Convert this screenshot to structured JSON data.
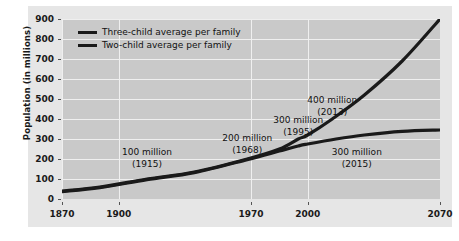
{
  "chart_data": {
    "type": "line",
    "title": "",
    "xlabel": "",
    "ylabel": "Population (in millions)",
    "xlim": [
      1870,
      2070
    ],
    "ylim": [
      0,
      900
    ],
    "grid": true,
    "legend_position": "top-left",
    "x_ticks": [
      "1870",
      "1900",
      "1970",
      "2000",
      "2070"
    ],
    "x_tick_values": [
      1870,
      1900,
      1970,
      2000,
      2070
    ],
    "y_ticks": [
      "0",
      "100",
      "200",
      "300",
      "400",
      "500",
      "600",
      "700",
      "800",
      "900"
    ],
    "y_tick_values": [
      0,
      100,
      200,
      300,
      400,
      500,
      600,
      700,
      800,
      900
    ],
    "series": [
      {
        "name": "Three-child average per family",
        "color": "#1a1a1a",
        "x": [
          1870,
          1890,
          1915,
          1940,
          1968,
          1985,
          1995,
          2000,
          2013,
          2030,
          2050,
          2070
        ],
        "values": [
          40,
          60,
          100,
          135,
          200,
          250,
          300,
          320,
          400,
          520,
          690,
          900
        ]
      },
      {
        "name": "Two-child average per family",
        "color": "#1a1a1a",
        "x": [
          1870,
          1890,
          1915,
          1940,
          1968,
          1985,
          1995,
          2000,
          2015,
          2030,
          2050,
          2070
        ],
        "values": [
          37,
          57,
          97,
          132,
          197,
          240,
          265,
          275,
          300,
          320,
          338,
          345
        ]
      }
    ],
    "annotations": [
      {
        "label": "100 million",
        "sublabel": "(1915)",
        "x": 1915,
        "y": 230
      },
      {
        "label": "200 million",
        "sublabel": "(1968)",
        "x": 1968,
        "y": 300
      },
      {
        "label": "300 million",
        "sublabel": "(1995)",
        "x": 1995,
        "y": 390
      },
      {
        "label": "400 million",
        "sublabel": "(2013)",
        "x": 2013,
        "y": 490
      },
      {
        "label": "300 million",
        "sublabel": "(2015)",
        "x": 2026,
        "y": 230
      }
    ]
  },
  "legend": {
    "items": [
      {
        "label": "Three-child average per family"
      },
      {
        "label": "Two-child average per family"
      }
    ]
  },
  "axes": {
    "y_title": "Population (in millions)",
    "y_labels": [
      "900",
      "800",
      "700",
      "600",
      "500",
      "400",
      "300",
      "200",
      "100",
      "0"
    ],
    "x_labels": [
      "1870",
      "1900",
      "1970",
      "2000",
      "2070"
    ]
  },
  "colors": {
    "line": "#1a1a1a",
    "plot_background": "#c9c9c9",
    "panel_background": "#e6e6e6",
    "gridline": "#efefef",
    "text": "#111111"
  }
}
